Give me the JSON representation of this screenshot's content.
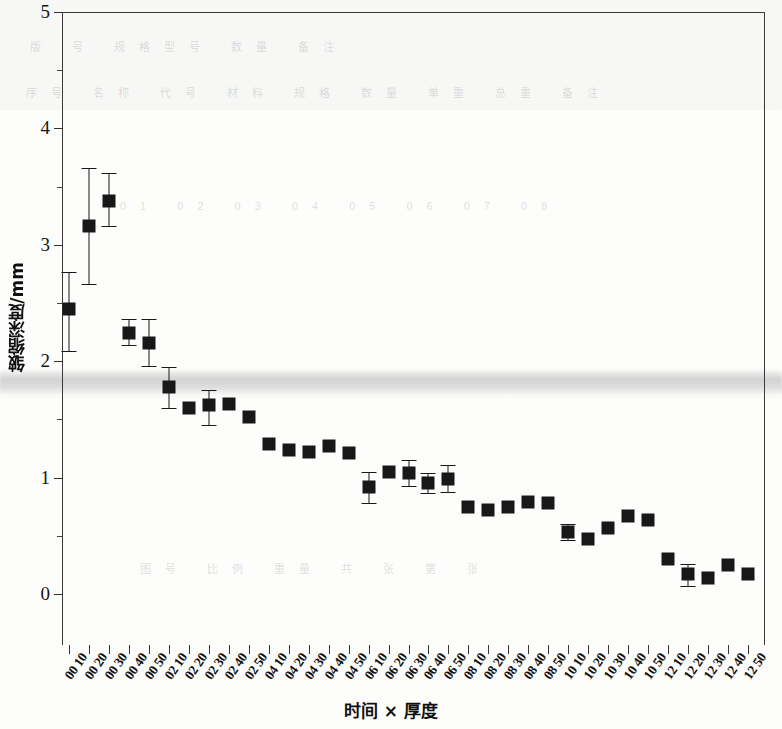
{
  "chart_data": {
    "type": "scatter",
    "title": "",
    "xlabel": "时间 × 厚度",
    "ylabel": "皱缩深度/mm",
    "ylim": [
      0,
      5
    ],
    "yticks": [
      0,
      1,
      2,
      3,
      4,
      5
    ],
    "ytick_labels": [
      "0",
      "1",
      "2",
      "3",
      "4",
      "5"
    ],
    "grid": false,
    "legend": null,
    "error_bars": "yes",
    "marker": "filled-square",
    "marker_color": "#181818",
    "categories": [
      "00 10",
      "00 20",
      "00 30",
      "00 40",
      "00 50",
      "02 10",
      "02 20",
      "02 30",
      "02 40",
      "02 50",
      "04 10",
      "04 20",
      "04 30",
      "04 40",
      "04 50",
      "06 10",
      "06 20",
      "06 30",
      "06 40",
      "06 50",
      "08 10",
      "08 20",
      "08 30",
      "08 40",
      "08 50",
      "10 10",
      "10 20",
      "10 30",
      "10 40",
      "10 50",
      "12 10",
      "12 20",
      "12 30",
      "12 40",
      "12 50"
    ],
    "values": [
      2.45,
      3.16,
      3.38,
      2.24,
      2.16,
      1.78,
      1.6,
      1.62,
      1.63,
      1.52,
      1.29,
      1.24,
      1.22,
      1.27,
      1.21,
      0.92,
      1.05,
      1.04,
      0.95,
      0.99,
      0.75,
      0.72,
      0.75,
      0.79,
      0.78,
      0.53,
      0.47,
      0.57,
      0.67,
      0.64,
      0.3,
      0.17,
      0.14,
      0.25,
      0.17
    ],
    "err_low": [
      0.36,
      0.5,
      0.22,
      0.1,
      0.2,
      0.18,
      0.06,
      0.17,
      0.06,
      0.05,
      0.04,
      0.05,
      0.04,
      0.06,
      0.03,
      0.14,
      0.04,
      0.11,
      0.08,
      0.11,
      0.03,
      0.03,
      0.02,
      0.03,
      0.03,
      0.07,
      0.03,
      0.04,
      0.05,
      0.03,
      0.03,
      0.1,
      0.05,
      0.04,
      0.06
    ],
    "err_high": [
      0.32,
      0.5,
      0.24,
      0.12,
      0.2,
      0.17,
      0.06,
      0.13,
      0.05,
      0.06,
      0.04,
      0.04,
      0.04,
      0.05,
      0.03,
      0.13,
      0.04,
      0.11,
      0.09,
      0.12,
      0.03,
      0.03,
      0.02,
      0.03,
      0.03,
      0.07,
      0.03,
      0.04,
      0.05,
      0.03,
      0.03,
      0.09,
      0.05,
      0.04,
      0.06
    ]
  },
  "background": {
    "rows": [
      "版 号 规格型号 数量 备注",
      "序号 名称 代号 材料 规格 数量 单重 总重 备注",
      "01 02 03 04 05 06 07 08",
      "图号 比例 重量 共 张 第 张"
    ]
  }
}
